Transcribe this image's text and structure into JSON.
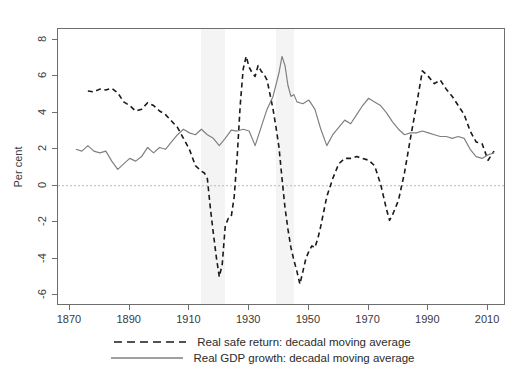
{
  "chart_data": {
    "type": "line",
    "title": "",
    "xlabel": "",
    "ylabel": "Per cent",
    "xlim": [
      1866,
      2016
    ],
    "ylim": [
      -6.6,
      8.6
    ],
    "xticks": [
      1870,
      1890,
      1910,
      1930,
      1950,
      1970,
      1990,
      2010
    ],
    "yticks": [
      -6,
      -4,
      -2,
      0,
      2,
      4,
      6,
      8
    ],
    "grid": false,
    "zero_line": true,
    "legend_position": "below",
    "shaded_bands": [
      {
        "label": "",
        "start": 1914,
        "end": 1922
      },
      {
        "label": "",
        "start": 1939,
        "end": 1945
      }
    ],
    "series": [
      {
        "name": "Real safe return: decadal moving average",
        "style": "dashed",
        "color": "#1a1a1a",
        "x": [
          1876,
          1878,
          1880,
          1882,
          1884,
          1886,
          1888,
          1890,
          1892,
          1894,
          1896,
          1898,
          1900,
          1902,
          1904,
          1906,
          1908,
          1910,
          1912,
          1914,
          1915,
          1916,
          1917,
          1918,
          1919,
          1920,
          1921,
          1922,
          1923,
          1924,
          1925,
          1926,
          1927,
          1928,
          1929,
          1930,
          1931,
          1932,
          1933,
          1934,
          1935,
          1936,
          1937,
          1938,
          1939,
          1940,
          1941,
          1942,
          1943,
          1944,
          1945,
          1946,
          1947,
          1948,
          1949,
          1950,
          1951,
          1952,
          1953,
          1954,
          1955,
          1956,
          1958,
          1960,
          1962,
          1964,
          1966,
          1968,
          1970,
          1972,
          1974,
          1976,
          1977,
          1978,
          1980,
          1982,
          1984,
          1986,
          1988,
          1990,
          1992,
          1994,
          1996,
          1998,
          2000,
          2002,
          2004,
          2006,
          2008,
          2010,
          2012
        ],
        "y": [
          5.2,
          5.15,
          5.3,
          5.25,
          5.35,
          5.1,
          4.6,
          4.4,
          4.1,
          4.2,
          4.55,
          4.4,
          4.1,
          3.9,
          3.55,
          3.2,
          2.6,
          2.0,
          1.1,
          0.8,
          0.7,
          0.4,
          -1.2,
          -2.6,
          -3.9,
          -5.0,
          -4.3,
          -2.2,
          -1.8,
          -1.7,
          -0.6,
          1.6,
          4.4,
          6.4,
          7.1,
          6.5,
          6.2,
          6.0,
          6.6,
          6.3,
          6.1,
          5.8,
          5.0,
          4.2,
          3.2,
          2.1,
          0.4,
          -1.2,
          -2.4,
          -3.4,
          -4.1,
          -4.7,
          -5.4,
          -4.7,
          -4.0,
          -3.6,
          -3.3,
          -3.4,
          -2.9,
          -2.2,
          -1.4,
          -0.6,
          0.4,
          1.2,
          1.5,
          1.5,
          1.6,
          1.5,
          1.4,
          1.1,
          0.1,
          -1.3,
          -1.9,
          -1.6,
          -0.8,
          0.7,
          2.6,
          4.4,
          6.3,
          6.0,
          5.6,
          5.8,
          5.3,
          4.9,
          4.4,
          3.9,
          3.0,
          2.4,
          2.3,
          1.4,
          1.9
        ]
      },
      {
        "name": "Real GDP growth: decadal moving average",
        "style": "solid",
        "color": "#808080",
        "x": [
          1872,
          1874,
          1876,
          1878,
          1880,
          1882,
          1884,
          1886,
          1888,
          1890,
          1892,
          1894,
          1896,
          1898,
          1900,
          1902,
          1904,
          1906,
          1908,
          1910,
          1912,
          1914,
          1916,
          1918,
          1920,
          1922,
          1924,
          1926,
          1928,
          1930,
          1932,
          1934,
          1936,
          1938,
          1940,
          1941,
          1942,
          1943,
          1944,
          1945,
          1946,
          1948,
          1950,
          1952,
          1954,
          1956,
          1958,
          1960,
          1962,
          1964,
          1966,
          1968,
          1970,
          1972,
          1974,
          1976,
          1978,
          1980,
          1982,
          1984,
          1986,
          1988,
          1990,
          1992,
          1994,
          1996,
          1998,
          2000,
          2002,
          2004,
          2006,
          2008,
          2010,
          2012
        ],
        "y": [
          2.0,
          1.9,
          2.2,
          1.9,
          1.8,
          1.9,
          1.35,
          0.9,
          1.2,
          1.5,
          1.35,
          1.6,
          2.1,
          1.8,
          2.1,
          2.0,
          2.4,
          2.8,
          3.1,
          2.9,
          2.8,
          3.1,
          2.8,
          2.6,
          2.2,
          2.6,
          3.05,
          3.0,
          3.1,
          3.0,
          2.2,
          3.2,
          4.2,
          4.9,
          6.2,
          7.1,
          6.6,
          5.5,
          4.9,
          5.0,
          4.6,
          4.5,
          4.7,
          4.2,
          3.1,
          2.2,
          2.8,
          3.2,
          3.6,
          3.4,
          3.9,
          4.4,
          4.8,
          4.6,
          4.4,
          4.0,
          3.5,
          3.1,
          2.8,
          2.9,
          2.9,
          3.0,
          2.9,
          2.8,
          2.7,
          2.7,
          2.6,
          2.7,
          2.6,
          2.0,
          1.6,
          1.5,
          1.7,
          1.8
        ]
      }
    ]
  },
  "axis": {
    "ylabel": "Per cent"
  },
  "legend": {
    "items": [
      {
        "label": "Real safe return: decadal moving average",
        "style": "dashed",
        "color": "#1a1a1a"
      },
      {
        "label": "Real GDP growth: decadal moving average",
        "style": "solid",
        "color": "#808080"
      }
    ]
  }
}
